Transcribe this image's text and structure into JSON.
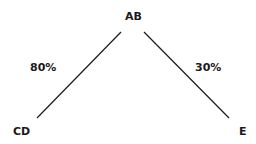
{
  "diagram": {
    "nodes": [
      {
        "id": "root",
        "label": "AB"
      },
      {
        "id": "left",
        "label": "CD"
      },
      {
        "id": "right",
        "label": "E"
      }
    ],
    "edges": [
      {
        "from": "root",
        "to": "left",
        "label": "80%"
      },
      {
        "from": "root",
        "to": "right",
        "label": "30%"
      }
    ],
    "colors": {
      "line": "#1a1a1a",
      "text": "#1a1a1a",
      "background": "#ffffff"
    }
  }
}
